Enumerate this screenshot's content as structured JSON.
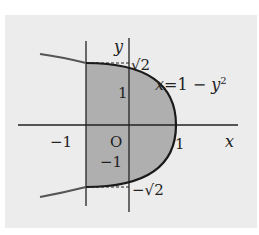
{
  "diagram": {
    "curve_label": "x=1 − y²",
    "curve_label_parts": {
      "x": "x",
      "eq": "=1 − ",
      "y": "y",
      "exp": "2"
    },
    "axis_labels": {
      "x": "x",
      "y": "y"
    },
    "origin_label": "O",
    "tick_labels": {
      "x_neg1": "−1",
      "x_pos1": "1",
      "y_pos1": "1",
      "y_neg1": "−1",
      "y_pos_sqrt2": "√2",
      "y_neg_sqrt2": "−√2"
    },
    "colors": {
      "background": "#ececec",
      "shade": "#a8a8a8",
      "curve": "#1a1a1a",
      "curve_outer": "#555555",
      "axis": "#222222"
    }
  }
}
